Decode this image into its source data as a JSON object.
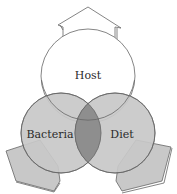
{
  "diagram": {
    "type": "venn",
    "circles": [
      {
        "label": "Host",
        "fill": "#ffffff"
      },
      {
        "label": "Bacteria",
        "fill": "#c8c8c8"
      },
      {
        "label": "Diet",
        "fill": "#c8c8c8"
      }
    ],
    "intersection_fill": "#8e8e8e",
    "arrows": [
      {
        "direction": "up",
        "fill": "#ffffff"
      },
      {
        "direction": "down-left",
        "fill": "#c8c8c8"
      },
      {
        "direction": "down-right",
        "fill": "#c8c8c8"
      }
    ],
    "stroke": "#555555"
  }
}
